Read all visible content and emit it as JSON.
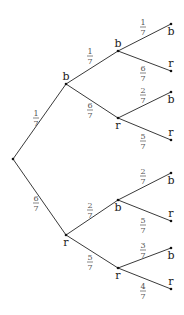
{
  "diagram": {
    "type": "probability-tree",
    "root": {
      "x": 13,
      "y": 159
    },
    "nodes": [
      {
        "id": "b1",
        "label": "b",
        "x": 66,
        "y": 84,
        "parent": "root",
        "prob_num": "1",
        "prob_den": "7",
        "label_pos": "above",
        "frac_x": 36,
        "frac_y": 118
      },
      {
        "id": "r1",
        "label": "r",
        "x": 66,
        "y": 235,
        "parent": "root",
        "prob_num": "6",
        "prob_den": "7",
        "label_pos": "below",
        "frac_x": 36,
        "frac_y": 203
      },
      {
        "id": "bb",
        "label": "b",
        "x": 118,
        "y": 51,
        "parent": "b1",
        "prob_num": "1",
        "prob_den": "7",
        "label_pos": "above",
        "frac_x": 90,
        "frac_y": 56
      },
      {
        "id": "br",
        "label": "r",
        "x": 118,
        "y": 118,
        "parent": "b1",
        "prob_num": "6",
        "prob_den": "7",
        "label_pos": "below",
        "frac_x": 90,
        "frac_y": 110
      },
      {
        "id": "rb",
        "label": "b",
        "x": 118,
        "y": 200,
        "parent": "r1",
        "prob_num": "2",
        "prob_den": "7",
        "label_pos": "below",
        "frac_x": 90,
        "frac_y": 210
      },
      {
        "id": "rr",
        "label": "r",
        "x": 118,
        "y": 268,
        "parent": "r1",
        "prob_num": "5",
        "prob_den": "7",
        "label_pos": "below",
        "frac_x": 90,
        "frac_y": 262
      },
      {
        "id": "bbb",
        "label": "b",
        "x": 171,
        "y": 24,
        "parent": "bb",
        "prob_num": "1",
        "prob_den": "7",
        "label_pos": "below",
        "frac_x": 143,
        "frac_y": 27
      },
      {
        "id": "bbr",
        "label": "r",
        "x": 171,
        "y": 71,
        "parent": "bb",
        "prob_num": "6",
        "prob_den": "7",
        "label_pos": "above",
        "frac_x": 143,
        "frac_y": 73
      },
      {
        "id": "brb",
        "label": "b",
        "x": 171,
        "y": 92,
        "parent": "br",
        "prob_num": "2",
        "prob_den": "7",
        "label_pos": "below",
        "frac_x": 143,
        "frac_y": 95
      },
      {
        "id": "brr",
        "label": "r",
        "x": 171,
        "y": 140,
        "parent": "br",
        "prob_num": "5",
        "prob_den": "7",
        "label_pos": "above",
        "frac_x": 143,
        "frac_y": 141
      },
      {
        "id": "rbb",
        "label": "b",
        "x": 171,
        "y": 173,
        "parent": "rb",
        "prob_num": "2",
        "prob_den": "7",
        "label_pos": "below",
        "frac_x": 143,
        "frac_y": 176
      },
      {
        "id": "rbr",
        "label": "r",
        "x": 171,
        "y": 221,
        "parent": "rb",
        "prob_num": "5",
        "prob_den": "7",
        "label_pos": "above",
        "frac_x": 143,
        "frac_y": 225
      },
      {
        "id": "rrb",
        "label": "b",
        "x": 171,
        "y": 248,
        "parent": "rr",
        "prob_num": "3",
        "prob_den": "7",
        "label_pos": "below",
        "frac_x": 143,
        "frac_y": 250
      },
      {
        "id": "rrr",
        "label": "r",
        "x": 171,
        "y": 289,
        "parent": "rr",
        "prob_num": "4",
        "prob_den": "7",
        "label_pos": "above",
        "frac_x": 143,
        "frac_y": 291
      }
    ]
  }
}
